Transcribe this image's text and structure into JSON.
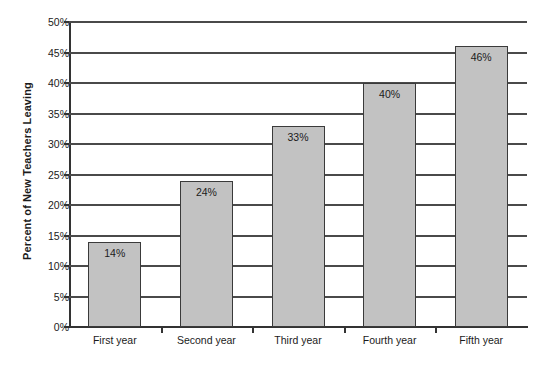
{
  "chart_data": {
    "type": "bar",
    "title": "",
    "subtitle": "",
    "xlabel": "",
    "ylabel": "Percent of New Teachers Leaving",
    "categories": [
      "First year",
      "Second year",
      "Third year",
      "Fourth year",
      "Fifth year"
    ],
    "values": [
      14,
      24,
      33,
      40,
      46
    ],
    "value_labels": [
      "14%",
      "24%",
      "33%",
      "40%",
      "46%"
    ],
    "ylim": [
      0,
      50
    ],
    "ytick_values": [
      0,
      5,
      10,
      15,
      20,
      25,
      30,
      35,
      40,
      45,
      50
    ],
    "ytick_labels": [
      "0%",
      "5%",
      "10%",
      "15%",
      "20%",
      "25%",
      "30%",
      "35%",
      "40%",
      "45%",
      "50%"
    ],
    "grid": "horizontal",
    "legend": "none",
    "colors": {
      "bar_fill": "#c2c2c2",
      "bar_border": "#3a3a3a",
      "gridline": "#4a4a4a",
      "axis": "#333333",
      "text": "#1b1b1b",
      "background": "#ffffff"
    }
  }
}
